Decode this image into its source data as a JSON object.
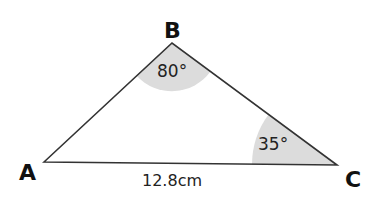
{
  "diagram": {
    "type": "triangle",
    "vertices": {
      "A": {
        "label": "A",
        "x": 44,
        "y": 162
      },
      "B": {
        "label": "B",
        "x": 172,
        "y": 43
      },
      "C": {
        "label": "C",
        "x": 337,
        "y": 165
      }
    },
    "angles": {
      "B": {
        "label": "80°",
        "value": 80
      },
      "C": {
        "label": "35°",
        "value": 35
      }
    },
    "sides": {
      "AC": {
        "label": "12.8cm",
        "length_cm": 12.8
      }
    },
    "colors": {
      "stroke": "#333333",
      "angle_fill": "#dcdcdc",
      "text": "#111111"
    }
  }
}
